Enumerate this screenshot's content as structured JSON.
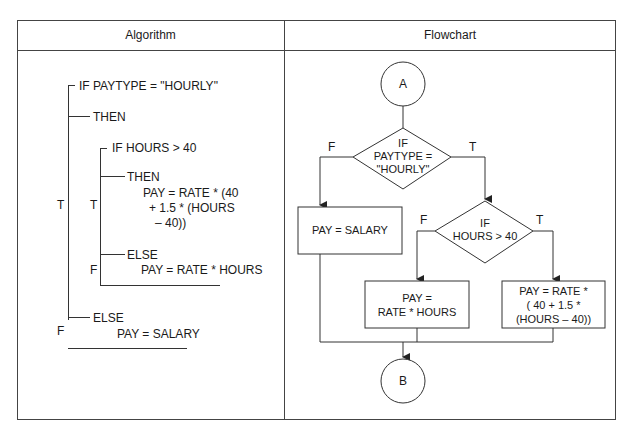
{
  "headers": {
    "algorithm": "Algorithm",
    "flowchart": "Flowchart"
  },
  "algorithm": {
    "if1": "IF PAYTYPE = \"HOURLY\"",
    "then1": "THEN",
    "if2": "IF HOURS > 40",
    "then2": "THEN",
    "then2_stmt": [
      "PAY = RATE * (40",
      "+ 1.5 * (HOURS",
      "– 40))"
    ],
    "else2": "ELSE",
    "else2_stmt": "PAY = RATE * HOURS",
    "else1": "ELSE",
    "else1_stmt": "PAY = SALARY",
    "outer_t": "T",
    "outer_f": "F",
    "inner_t": "T",
    "inner_f": "F"
  },
  "flowchart": {
    "start_connector": "A",
    "end_connector": "B",
    "decision1": [
      "IF",
      "PAYTYPE =",
      "\"HOURLY\""
    ],
    "decision1_false": "F",
    "decision1_true": "T",
    "decision2": [
      "IF",
      "HOURS > 40"
    ],
    "decision2_false": "F",
    "decision2_true": "T",
    "process_salary": "PAY = SALARY",
    "process_regular": [
      "PAY =",
      "RATE * HOURS"
    ],
    "process_overtime": [
      "PAY = RATE *",
      "( 40 + 1.5 *",
      "(HOURS – 40))"
    ]
  }
}
